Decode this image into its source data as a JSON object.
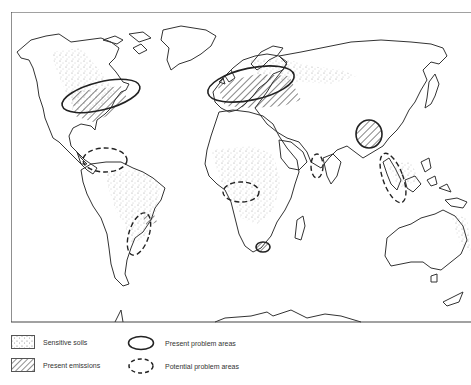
{
  "map": {
    "title": "",
    "projection": "world outline map",
    "overlays": {
      "present_emissions_regions": [
        "Eastern North America",
        "Europe / Western Russia",
        "Eastern China",
        "South Africa (Transvaal)",
        "South-east Brazil",
        "South-east Australia"
      ],
      "present_problem_areas": [
        "North-eastern USA / South-eastern Canada",
        "Northern & Central Europe",
        "Southern China",
        "South Africa (Transvaal)"
      ],
      "potential_problem_areas": [
        "Northern South America (Venezuela/Colombia)",
        "South-east Brazil",
        "West Africa (Nigeria)",
        "South-east Asia (Malaysia/Indonesia)",
        "South India"
      ],
      "sensitive_soils_regions": [
        "Canada / Eastern USA",
        "Scandinavia / Russia",
        "Amazon basin",
        "Central & West Africa",
        "South-east Asia",
        "Eastern Australia"
      ]
    }
  },
  "legend": {
    "items": [
      {
        "id": "sensitive-soils",
        "label": "Sensitive soils",
        "symbol": "stipple"
      },
      {
        "id": "present-emissions",
        "label": "Present emissions",
        "symbol": "hatch"
      },
      {
        "id": "present-problem",
        "label": "Present problem areas",
        "symbol": "solid-ellipse"
      },
      {
        "id": "potential-problem",
        "label": "Potential problem areas",
        "symbol": "dashed-ellipse"
      }
    ]
  },
  "colors": {
    "ink": "#333333",
    "paper": "#ffffff",
    "stipple": "#8a8a8a"
  }
}
